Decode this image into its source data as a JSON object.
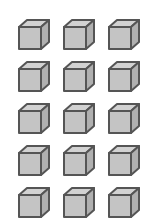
{
  "figure": {
    "rows": 5,
    "columns": 3,
    "total_cubes": 15,
    "colors": {
      "front_face": "#c4c4c4",
      "top_face": "#d2d2d2",
      "side_face": "#b0b0b0",
      "outline": "#555555"
    }
  }
}
